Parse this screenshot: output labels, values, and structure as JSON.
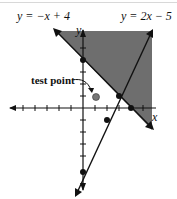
{
  "figure": {
    "line1_label": "y = −x + 4",
    "line2_label": "y = 2x − 5",
    "x_axis_label": "x",
    "y_axis_label": "y",
    "test_point_label": "test point"
  },
  "colors": {
    "shade": "#6e6e6e",
    "line": "#111111",
    "point": "#777777"
  },
  "lines": [
    {
      "equation": "y = -x + 4",
      "marked_points": [
        [
          0,
          4
        ],
        [
          3,
          1
        ],
        [
          4,
          0
        ]
      ]
    },
    {
      "equation": "y = 2x - 5",
      "marked_points": [
        [
          0,
          -5
        ],
        [
          2,
          -1
        ],
        [
          3,
          1
        ]
      ]
    }
  ],
  "test_point": [
    1,
    2
  ]
}
